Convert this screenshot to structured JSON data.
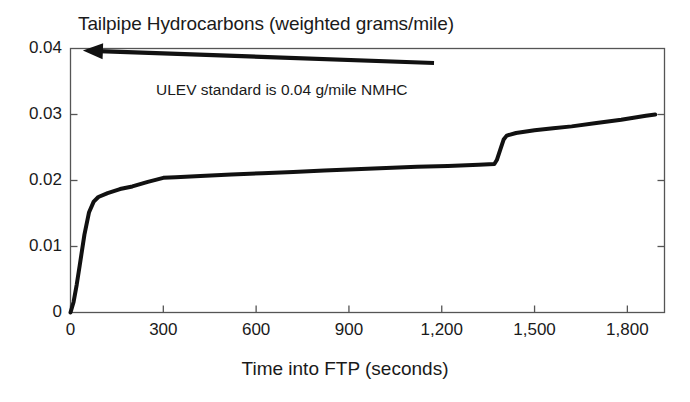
{
  "chart_data": {
    "type": "line",
    "title": "Tailpipe Hydrocarbons (weighted grams/mile)",
    "xlabel": "Time into FTP (seconds)",
    "ylabel": "",
    "xlim": [
      0,
      1920
    ],
    "ylim": [
      0,
      0.04
    ],
    "grid": false,
    "legend": null,
    "xticks": [
      0,
      300,
      600,
      900,
      1200,
      1500,
      1800
    ],
    "xtick_labels": [
      "0",
      "300",
      "600",
      "900",
      "1,200",
      "1,500",
      "1,800"
    ],
    "yticks": [
      0,
      0.01,
      0.02,
      0.03,
      0.04
    ],
    "ytick_labels": [
      "0",
      "0.01",
      "0.02",
      "0.03",
      "0.04"
    ],
    "series": [
      {
        "name": "Cumulative weighted tailpipe NMHC",
        "color": "#111111",
        "line_width": 4,
        "x": [
          0,
          10,
          20,
          30,
          45,
          60,
          75,
          90,
          120,
          160,
          200,
          250,
          300,
          340,
          420,
          520,
          620,
          720,
          820,
          920,
          1020,
          1120,
          1220,
          1320,
          1370,
          1378,
          1390,
          1400,
          1410,
          1440,
          1500,
          1560,
          1620,
          1700,
          1780,
          1860,
          1890
        ],
        "y": [
          0.0,
          0.0016,
          0.0042,
          0.0072,
          0.0118,
          0.0152,
          0.0168,
          0.0175,
          0.0181,
          0.0187,
          0.0191,
          0.0198,
          0.0204,
          0.0205,
          0.0207,
          0.0209,
          0.0211,
          0.0213,
          0.0215,
          0.0217,
          0.0219,
          0.0221,
          0.0222,
          0.0224,
          0.0225,
          0.0231,
          0.0248,
          0.0262,
          0.0268,
          0.0272,
          0.0276,
          0.0279,
          0.0282,
          0.0287,
          0.0292,
          0.0298,
          0.03
        ]
      }
    ],
    "annotations": [
      {
        "name": "ulev-standard-note",
        "text": "ULEV standard is 0.04 g/mile NMHC",
        "arrow_from": [
          1175,
          0.0378
        ],
        "arrow_to": [
          40,
          0.0397
        ]
      }
    ],
    "frame": {
      "color": "#555555",
      "visible": true
    }
  }
}
